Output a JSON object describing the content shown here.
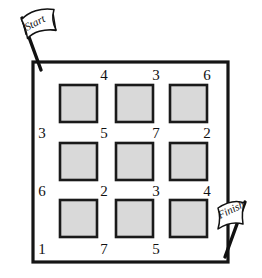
{
  "figure": {
    "background_color": "#ffffff",
    "frame": {
      "name": "outer-square-border",
      "stroke_color": "#151515",
      "x": 33,
      "y": 62,
      "width": 195,
      "height": 200
    },
    "tile": {
      "fill_color": "#d9d9d9",
      "stroke_color": "#1a1a1a",
      "size": 37
    }
  },
  "flags": [
    {
      "id": "start-flag",
      "label": "Start",
      "corner": "top-left",
      "pole_from": [
        22,
        18
      ],
      "pole_to": [
        41,
        70
      ]
    },
    {
      "id": "finish-flag",
      "label": "Finish",
      "corner": "bottom-right",
      "pole_from": [
        244,
        203
      ],
      "pole_to": [
        224,
        256
      ]
    }
  ],
  "tiles": [
    {
      "id": "tile-r1c1",
      "row": 1,
      "col": 1,
      "x": 60,
      "y": 85
    },
    {
      "id": "tile-r1c2",
      "row": 1,
      "col": 2,
      "x": 116,
      "y": 85
    },
    {
      "id": "tile-r1c3",
      "row": 1,
      "col": 3,
      "x": 170,
      "y": 85
    },
    {
      "id": "tile-r2c1",
      "row": 2,
      "col": 1,
      "x": 60,
      "y": 143
    },
    {
      "id": "tile-r2c2",
      "row": 2,
      "col": 2,
      "x": 116,
      "y": 143
    },
    {
      "id": "tile-r2c3",
      "row": 2,
      "col": 3,
      "x": 170,
      "y": 143
    },
    {
      "id": "tile-r3c1",
      "row": 3,
      "col": 1,
      "x": 60,
      "y": 200
    },
    {
      "id": "tile-r3c2",
      "row": 3,
      "col": 2,
      "x": 116,
      "y": 200
    },
    {
      "id": "tile-r3c3",
      "row": 3,
      "col": 3,
      "x": 170,
      "y": 200
    }
  ],
  "numbers": [
    {
      "id": "num-top-1",
      "value": "4",
      "x": 104,
      "y": 68
    },
    {
      "id": "num-top-2",
      "value": "3",
      "x": 156,
      "y": 68
    },
    {
      "id": "num-top-3",
      "value": "6",
      "x": 207,
      "y": 68
    },
    {
      "id": "num-mid1-1",
      "value": "3",
      "x": 42,
      "y": 126
    },
    {
      "id": "num-mid1-2",
      "value": "5",
      "x": 104,
      "y": 126
    },
    {
      "id": "num-mid1-3",
      "value": "7",
      "x": 156,
      "y": 126
    },
    {
      "id": "num-mid1-4",
      "value": "2",
      "x": 207,
      "y": 126
    },
    {
      "id": "num-mid2-1",
      "value": "6",
      "x": 42,
      "y": 184
    },
    {
      "id": "num-mid2-2",
      "value": "2",
      "x": 104,
      "y": 184
    },
    {
      "id": "num-mid2-3",
      "value": "3",
      "x": 156,
      "y": 184
    },
    {
      "id": "num-mid2-4",
      "value": "4",
      "x": 207,
      "y": 184
    },
    {
      "id": "num-bottom-1",
      "value": "1",
      "x": 42,
      "y": 242
    },
    {
      "id": "num-bottom-2",
      "value": "7",
      "x": 104,
      "y": 242
    },
    {
      "id": "num-bottom-3",
      "value": "5",
      "x": 156,
      "y": 242
    }
  ]
}
